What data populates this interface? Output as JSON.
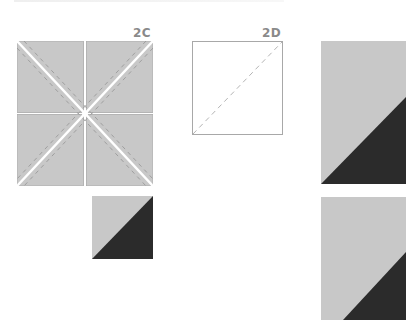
{
  "figure": {
    "panels": [
      {
        "id": "2C",
        "label": "2C",
        "description": "Four gray squares joined as a larger square, cut on both diagonals with dashed stitch lines on either side of each cut"
      },
      {
        "id": "2D",
        "label": "2D",
        "description": "White square with a dashed diagonal line from bottom-left to top-right"
      }
    ],
    "results": [
      {
        "name": "small-half-square-triangle",
        "light_corner": "top-left",
        "dark_corner": "bottom-right"
      },
      {
        "name": "tall-rectangle-top",
        "light_corner": "top-left",
        "dark_corner": "bottom-right"
      },
      {
        "name": "tall-rectangle-bottom",
        "light_corner": "top-left",
        "dark_corner": "bottom-right"
      }
    ],
    "colors": {
      "light_fabric": "#c8c8c8",
      "dark_fabric": "#2b2b2b",
      "label": "#8a8a8a",
      "outline": "#a8a8a8",
      "cut_line": "#ffffff",
      "stitch_line": "#9a9a9a"
    }
  }
}
